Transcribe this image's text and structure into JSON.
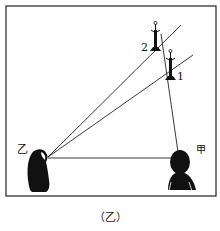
{
  "diagram": {
    "caption": "（乙）",
    "observers": [
      {
        "id": "yi",
        "label": "乙"
      },
      {
        "id": "jia",
        "label": "甲"
      }
    ],
    "lamps": [
      {
        "id": "lamp-1",
        "label": "1"
      },
      {
        "id": "lamp-2",
        "label": "2"
      }
    ]
  }
}
